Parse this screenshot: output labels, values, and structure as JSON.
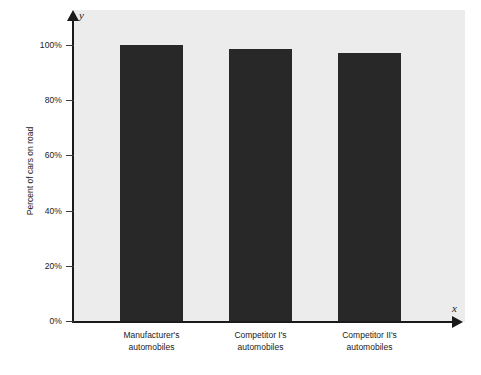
{
  "chart_data": {
    "type": "bar",
    "title": "",
    "subtitle": "",
    "xlabel": "",
    "ylabel": "Percent of cars on road",
    "x_axis_variable": "x",
    "y_axis_variable": "y",
    "categories": [
      "Manufacturer's automobiles",
      "Competitor I's automobiles",
      "Competitor II's automobiles"
    ],
    "category_lines": [
      [
        "Manufacturer's",
        "automobiles"
      ],
      [
        "Competitor I's",
        "automobiles"
      ],
      [
        "Competitor II's",
        "automobiles"
      ]
    ],
    "values": [
      100,
      98.5,
      97
    ],
    "value_labels": [
      "100%",
      "98.5%",
      "97%"
    ],
    "ylim": [
      0,
      110
    ],
    "yticks": [
      0,
      20,
      40,
      60,
      80,
      100
    ],
    "ytick_labels": [
      "0%",
      "20%",
      "40%",
      "60%",
      "80%",
      "100%"
    ],
    "grid": false,
    "legend": false,
    "legend_position": "none",
    "bar_color": "#282828",
    "panel_color": "#ececec",
    "axis_color": "#1a1a1a",
    "page_background": "#ffffff"
  }
}
